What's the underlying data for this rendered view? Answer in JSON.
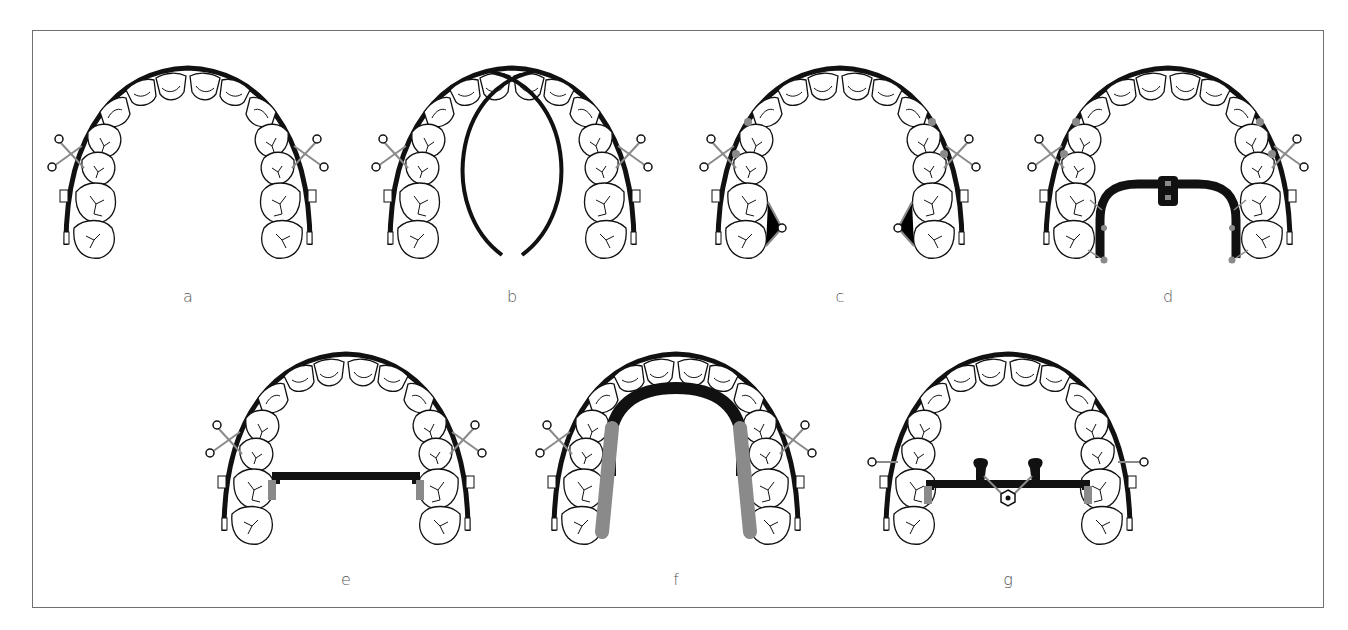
{
  "figure": {
    "panels": [
      {
        "id": "a",
        "label": "a",
        "appliance": "none"
      },
      {
        "id": "b",
        "label": "b",
        "appliance": "crossed-wire-loop"
      },
      {
        "id": "c",
        "label": "c",
        "appliance": "molar-elastic-anchors"
      },
      {
        "id": "d",
        "label": "d",
        "appliance": "transpalatal-arch-with-lock"
      },
      {
        "id": "e",
        "label": "e",
        "appliance": "straight-transpalatal-bar"
      },
      {
        "id": "f",
        "label": "f",
        "appliance": "u-shaped-palatal-arch-gray-pads"
      },
      {
        "id": "g",
        "label": "g",
        "appliance": "palatal-bar-with-hooks-and-screw"
      }
    ]
  },
  "colors": {
    "line": "#111111",
    "gray": "#8a8a8a",
    "frame": "#707070",
    "label": "#555555"
  }
}
